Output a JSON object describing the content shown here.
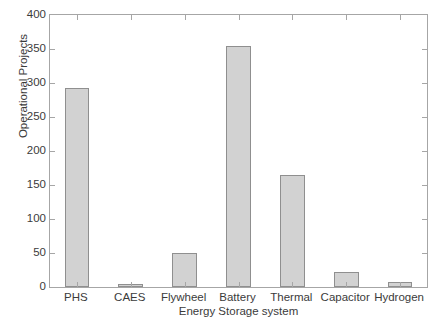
{
  "chart_data": {
    "type": "bar",
    "title": "",
    "xlabel": "Energy Storage system",
    "ylabel": "Operational Projects",
    "categories": [
      "PHS",
      "CAES",
      "Flywheel",
      "Battery",
      "Thermal",
      "Capacitor",
      "Hydrogen"
    ],
    "values": [
      292,
      5,
      50,
      355,
      165,
      22,
      8
    ],
    "ylim": [
      0,
      400
    ],
    "yticks": [
      0,
      50,
      100,
      150,
      200,
      250,
      300,
      350,
      400
    ],
    "ytick_labels": [
      "0",
      "50",
      "100",
      "150",
      "200",
      "250",
      "300",
      "350",
      "400"
    ],
    "grid": false,
    "legend": null,
    "bar_fill_color": "#d2d2d2",
    "bar_edge_color": "#8f8f8f",
    "axis_color": "#a6a6a6",
    "text_color": "#3b3b3b",
    "background_color": "#ffffff"
  }
}
